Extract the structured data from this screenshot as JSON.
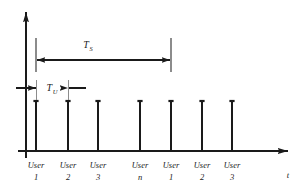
{
  "figure": {
    "background_color": "#ffffff",
    "line_color": "#1a1a1a",
    "ext_line_color": "#8c8c8c",
    "width": 307,
    "height": 193
  },
  "axes": {
    "x_axis": {
      "label": "t",
      "label_x": 288,
      "label_y": 177,
      "y": 151,
      "x_start": 18,
      "x_end": 291,
      "arrow": true
    },
    "y_axis": {
      "label": "",
      "x": 26,
      "y_top": 9,
      "y_bottom": 158,
      "arrow": true
    }
  },
  "chart_data": {
    "type": "bar",
    "title": "",
    "subtitle": "",
    "xlabel": "t",
    "ylabel": "",
    "grid": false,
    "legend": "none",
    "categories": [
      "User 1",
      "User 2",
      "User 3",
      "User n",
      "User 1",
      "User 2",
      "User 3"
    ],
    "category_lines": [
      [
        "User",
        "1"
      ],
      [
        "User",
        "2"
      ],
      [
        "User",
        "3"
      ],
      [
        "User",
        "n"
      ],
      [
        "User",
        "1"
      ],
      [
        "User",
        "2"
      ],
      [
        "User",
        "3"
      ]
    ],
    "x": [
      36,
      68,
      98,
      140,
      171,
      202,
      232
    ],
    "values": [
      1,
      1,
      1,
      1,
      1,
      1,
      1
    ],
    "pulse_top_y": 101,
    "baseline_y": 151,
    "ylim": [
      0,
      1.2
    ],
    "note": "Seven unit impulses of equal height, one per user time slot; the sequence repeats after User n."
  },
  "annotations": [
    {
      "id": "frame-duration",
      "name": "T_S",
      "symbol": "T",
      "subscript": "S",
      "label_x": 88,
      "label_y": 48,
      "arrow_y": 60,
      "x_from": 36,
      "x_to": 171,
      "ext_top_y": 38,
      "ext_bottom_y": 72,
      "style": "double-headed-outward",
      "meaning": "Frame (superframe) period spanning all user slots"
    },
    {
      "id": "slot-duration",
      "name": "T_U",
      "symbol": "T",
      "subscript": "U",
      "label_x": 52,
      "label_y": 91,
      "arrow_y": 88,
      "x_from": 36,
      "x_to": 68,
      "style": "double-headed-inward",
      "meaning": "Individual user slot duration"
    }
  ]
}
